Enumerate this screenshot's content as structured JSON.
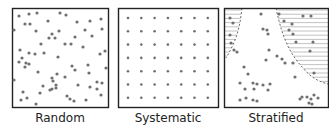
{
  "colors": {
    "dot": "#707070",
    "border": "#222222",
    "hatch": "#a8a8a8"
  },
  "panels": [
    {
      "id": "random",
      "label": "Random",
      "box": {
        "x": 12,
        "y": 8,
        "w": 96,
        "h": 99
      },
      "dots": [
        [
          19,
          16
        ],
        [
          29,
          14
        ],
        [
          37,
          13
        ],
        [
          60,
          13
        ],
        [
          66,
          15
        ],
        [
          25,
          24
        ],
        [
          30,
          24
        ],
        [
          48,
          21
        ],
        [
          77,
          22
        ],
        [
          90,
          21
        ],
        [
          101,
          19
        ],
        [
          14,
          30
        ],
        [
          36,
          31
        ],
        [
          59,
          31
        ],
        [
          85,
          30
        ],
        [
          102,
          29
        ],
        [
          52,
          34
        ],
        [
          49,
          38
        ],
        [
          55,
          38
        ],
        [
          75,
          37
        ],
        [
          92,
          36
        ],
        [
          41,
          44
        ],
        [
          65,
          44
        ],
        [
          71,
          44
        ],
        [
          83,
          47
        ],
        [
          20,
          50
        ],
        [
          29,
          53
        ],
        [
          35,
          54
        ],
        [
          44,
          53
        ],
        [
          58,
          57
        ],
        [
          100,
          54
        ],
        [
          105,
          51
        ],
        [
          22,
          58
        ],
        [
          26,
          63
        ],
        [
          19,
          62
        ],
        [
          29,
          64
        ],
        [
          25,
          67
        ],
        [
          72,
          66
        ],
        [
          75,
          70
        ],
        [
          88,
          65
        ],
        [
          106,
          68
        ],
        [
          38,
          72
        ],
        [
          57,
          74
        ],
        [
          52,
          78
        ],
        [
          65,
          77
        ],
        [
          89,
          73
        ],
        [
          14,
          80
        ],
        [
          43,
          86
        ],
        [
          53,
          81
        ],
        [
          56,
          85
        ],
        [
          52,
          89
        ],
        [
          56,
          88
        ],
        [
          50,
          90
        ],
        [
          78,
          85
        ],
        [
          90,
          87
        ],
        [
          97,
          82
        ],
        [
          102,
          83
        ],
        [
          97,
          89
        ],
        [
          40,
          93
        ],
        [
          23,
          92
        ],
        [
          27,
          98
        ],
        [
          21,
          100
        ],
        [
          67,
          96
        ],
        [
          70,
          99
        ],
        [
          74,
          101
        ],
        [
          86,
          100
        ],
        [
          36,
          104
        ],
        [
          101,
          95
        ]
      ]
    },
    {
      "id": "systematic",
      "label": "Systematic",
      "box": {
        "x": 118,
        "y": 8,
        "w": 100,
        "h": 99
      },
      "grid": {
        "rows": 7,
        "cols": 7,
        "x0": 128,
        "y0": 18,
        "dx": 13.3,
        "dy": 13.3
      }
    },
    {
      "id": "stratified",
      "label": "Stratified",
      "box": {
        "x": 224,
        "y": 8,
        "w": 104,
        "h": 99
      },
      "dots": [
        [
          230,
          18
        ],
        [
          233,
          23
        ],
        [
          230,
          35
        ],
        [
          231,
          43
        ],
        [
          234,
          50
        ],
        [
          237,
          52
        ],
        [
          261,
          14
        ],
        [
          279,
          14
        ],
        [
          284,
          21
        ],
        [
          303,
          16
        ],
        [
          311,
          16
        ],
        [
          292,
          24
        ],
        [
          263,
          29
        ],
        [
          267,
          30
        ],
        [
          268,
          34
        ],
        [
          289,
          30
        ],
        [
          293,
          34
        ],
        [
          296,
          42
        ],
        [
          313,
          42
        ],
        [
          269,
          50
        ],
        [
          310,
          51
        ],
        [
          277,
          56
        ],
        [
          282,
          59
        ],
        [
          266,
          60
        ],
        [
          285,
          63
        ],
        [
          293,
          63
        ],
        [
          244,
          67
        ],
        [
          248,
          74
        ],
        [
          314,
          73
        ],
        [
          295,
          77
        ],
        [
          240,
          83
        ],
        [
          253,
          83
        ],
        [
          257,
          84
        ],
        [
          263,
          85
        ],
        [
          245,
          89
        ],
        [
          254,
          89
        ],
        [
          270,
          84
        ],
        [
          268,
          90
        ],
        [
          240,
          100
        ],
        [
          246,
          98
        ],
        [
          253,
          100
        ],
        [
          257,
          101
        ],
        [
          300,
          99
        ],
        [
          302,
          97
        ],
        [
          307,
          97
        ],
        [
          311,
          99
        ],
        [
          314,
          95
        ],
        [
          318,
          98
        ],
        [
          309,
          103
        ],
        [
          312,
          104
        ]
      ]
    }
  ]
}
